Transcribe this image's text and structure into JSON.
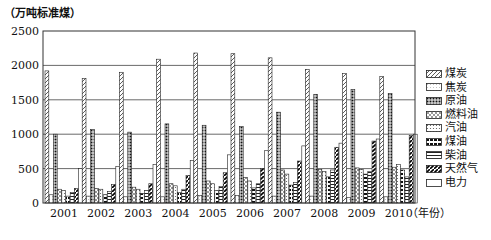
{
  "chart_data": {
    "type": "bar",
    "title": "",
    "ylabel": "（万吨标准煤）",
    "xlabel": "（年份）",
    "ylim": [
      0,
      2500
    ],
    "yticks": [
      0,
      500,
      1000,
      1500,
      2000,
      2500
    ],
    "grid": "horizontal",
    "legend_position": "right",
    "categories": [
      "2001",
      "2002",
      "2003",
      "2004",
      "2005",
      "2006",
      "2007",
      "2008",
      "2009",
      "2010"
    ],
    "series": [
      {
        "name": "煤炭",
        "pattern": "diagonal-hatch",
        "values": [
          1920,
          1810,
          1900,
          2090,
          2180,
          2170,
          2110,
          1940,
          1880,
          1840
        ]
      },
      {
        "name": "焦炭",
        "pattern": "light-dots",
        "values": [
          120,
          100,
          90,
          90,
          110,
          110,
          100,
          100,
          80,
          90
        ]
      },
      {
        "name": "原油",
        "pattern": "dense-dots",
        "values": [
          1000,
          1070,
          1030,
          1150,
          1130,
          1110,
          1320,
          1580,
          1650,
          1590
        ]
      },
      {
        "name": "燃料油",
        "pattern": "cross-hatch",
        "values": [
          200,
          210,
          230,
          280,
          320,
          370,
          480,
          490,
          510,
          520
        ]
      },
      {
        "name": "汽油",
        "pattern": "fine-dots",
        "values": [
          180,
          200,
          200,
          250,
          280,
          320,
          420,
          460,
          490,
          560
        ]
      },
      {
        "name": "煤油",
        "pattern": "dark-blocks",
        "values": [
          100,
          120,
          140,
          150,
          180,
          220,
          260,
          380,
          420,
          480
        ]
      },
      {
        "name": "柴油",
        "pattern": "horizontal-lines",
        "values": [
          150,
          170,
          180,
          200,
          240,
          280,
          300,
          480,
          460,
          380
        ]
      },
      {
        "name": "天然气",
        "pattern": "dark-diagonal",
        "values": [
          210,
          270,
          280,
          400,
          440,
          500,
          610,
          810,
          900,
          980
        ]
      },
      {
        "name": "电力",
        "pattern": "blank",
        "values": [
          500,
          530,
          560,
          620,
          700,
          760,
          830,
          870,
          930,
          1000
        ]
      }
    ]
  },
  "axis": {
    "y_unit": "（万吨标准煤）",
    "x_unit": "（年份）"
  }
}
